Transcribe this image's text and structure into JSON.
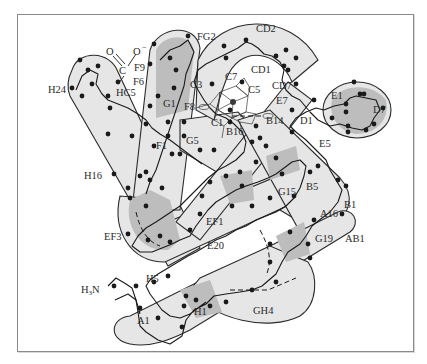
{
  "diagram": {
    "colors": {
      "helix_fill_light": "#e6e6e6",
      "helix_fill_dark": "#bdbdbd",
      "outline": "#2b2b2b",
      "background": "#ffffff",
      "frame_border": "#8a8a8a"
    },
    "labels": {
      "fg2": "FG2",
      "cd2": "CD2",
      "o_left": "O",
      "o_right": "O",
      "o_charge": "−",
      "c_carboxyl": "C",
      "f9": "F9",
      "f6": "F6",
      "h24": "H24",
      "hc5": "HC5",
      "c3": "C3",
      "c7": "C7",
      "cd1": "CD1",
      "cd7": "CD7",
      "c5": "C5",
      "g1": "G1",
      "f8": "F8",
      "e7": "E7",
      "e1": "E1",
      "d7": "D7",
      "c1": "C1",
      "b14": "B14",
      "d1": "D1",
      "b16": "B16",
      "e5": "E5",
      "f1": "F1",
      "g5": "G5",
      "h16": "H16",
      "g15": "G15",
      "b5": "B5",
      "b1": "B1",
      "a16": "A16",
      "ef1": "EF1",
      "g19": "G19",
      "ab1": "AB1",
      "ef3": "EF3",
      "e20": "E20",
      "h5": "H5",
      "h3n": "H",
      "h3n_sub": "3",
      "h3n_n": "N",
      "a1": "A1",
      "h1": "H1",
      "gh4": "GH4"
    }
  }
}
